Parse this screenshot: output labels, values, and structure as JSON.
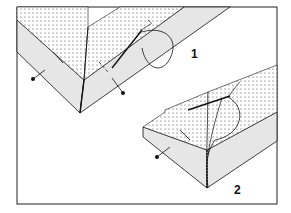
{
  "figure": {
    "step_labels": [
      "1",
      "2"
    ],
    "colors": {
      "frame": "#222222",
      "fabric_band": "#e6e6e6",
      "dotted_area": "#ffffff",
      "stroke": "#111111"
    }
  }
}
